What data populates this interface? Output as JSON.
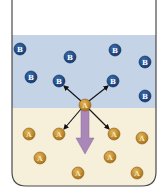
{
  "diagram": {
    "type": "beaker-two-phase-diffusion",
    "colors": {
      "background": "#ffffff",
      "beaker_outline": "#4a4a4a",
      "upper_phase": "#c5d3e6",
      "lower_phase": "#f6efd9",
      "b_particle": "#1f4e8c",
      "b_text": "#ffffff",
      "a_particle": "#c8922e",
      "a_text": "#f6e3b0",
      "arrow": "#111111",
      "big_arrow": "#a987b8"
    },
    "upper_phase": {
      "label": "B",
      "particles": [
        {
          "label": "B",
          "x": 20,
          "y": 49
        },
        {
          "label": "B",
          "x": 70,
          "y": 57
        },
        {
          "label": "B",
          "x": 115,
          "y": 50
        },
        {
          "label": "B",
          "x": 145,
          "y": 62
        },
        {
          "label": "B",
          "x": 31,
          "y": 77
        },
        {
          "label": "B",
          "x": 59,
          "y": 81
        },
        {
          "label": "B",
          "x": 113,
          "y": 81
        },
        {
          "label": "B",
          "x": 145,
          "y": 96
        }
      ]
    },
    "lower_phase": {
      "label": "A",
      "particles": [
        {
          "label": "A",
          "x": 29,
          "y": 134
        },
        {
          "label": "A",
          "x": 59,
          "y": 134
        },
        {
          "label": "A",
          "x": 114,
          "y": 134
        },
        {
          "label": "A",
          "x": 142,
          "y": 138
        },
        {
          "label": "A",
          "x": 40,
          "y": 158
        },
        {
          "label": "A",
          "x": 110,
          "y": 157
        },
        {
          "label": "A",
          "x": 78,
          "y": 173
        },
        {
          "label": "A",
          "x": 137,
          "y": 173
        }
      ]
    },
    "central_particle": {
      "label": "A",
      "x": 85,
      "y": 105
    },
    "interface_y": 108
  }
}
